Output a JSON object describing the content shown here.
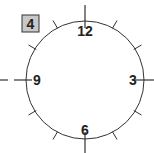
{
  "problem": {
    "number_label": "4"
  },
  "clock": {
    "center": [
      85,
      80
    ],
    "radius": 59,
    "numbers": [
      {
        "label": "12",
        "angle_deg": 0
      },
      {
        "label": "3",
        "angle_deg": 90
      },
      {
        "label": "6",
        "angle_deg": 180
      },
      {
        "label": "9",
        "angle_deg": 270
      }
    ],
    "hour_tick_count": 12,
    "hands": "none",
    "colors": {
      "stroke": "#333333",
      "box_fill": "#c8c8c8",
      "box_border": "#333333"
    }
  }
}
